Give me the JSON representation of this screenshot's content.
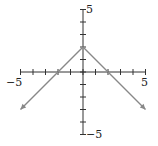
{
  "chart_data": {
    "type": "line",
    "title": "",
    "xlabel": "",
    "ylabel": "",
    "xlim": [
      -5,
      5
    ],
    "ylim": [
      -5,
      5
    ],
    "grid": false,
    "tick_step": 1,
    "tick_labels": {
      "x_min": "−5",
      "x_max": "5",
      "y_min": "−5",
      "y_max": "5"
    },
    "series": [
      {
        "name": "y = 2 − |x|",
        "x": [
          -5,
          0,
          5
        ],
        "y": [
          -3,
          2,
          -3
        ],
        "color": "#888888",
        "arrows": true
      }
    ]
  }
}
